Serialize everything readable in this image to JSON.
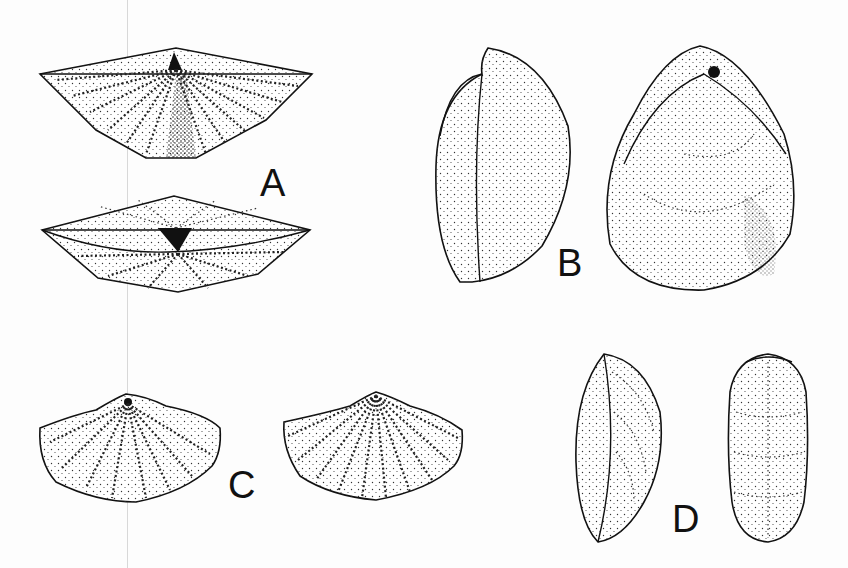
{
  "plate": {
    "figures": [
      {
        "id": "A",
        "label": "A",
        "description": "Two views of a wide, strongly ribbed brachiopod shell (dorsal view and anterior/hinge view)"
      },
      {
        "id": "B",
        "label": "B",
        "description": "Two views of a smooth, stippled rounded shell (lateral view and ventral view)"
      },
      {
        "id": "C",
        "label": "C",
        "description": "Two views of a fan-shaped ribbed brachiopod shell"
      },
      {
        "id": "D",
        "label": "D",
        "description": "Two views of an elongate oval shell with fine concentric/radial ornament"
      }
    ]
  },
  "colors": {
    "background": "#fdfdfd",
    "ink": "#111111"
  }
}
